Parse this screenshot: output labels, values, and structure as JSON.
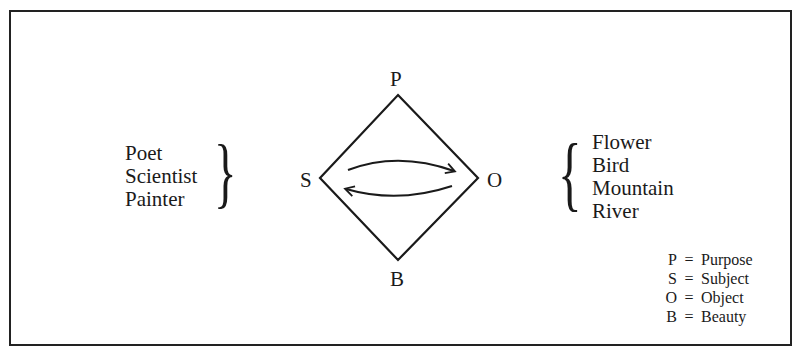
{
  "diagram": {
    "nodes": {
      "top": {
        "label": "P"
      },
      "left": {
        "label": "S"
      },
      "right": {
        "label": "O"
      },
      "bottom": {
        "label": "B"
      }
    },
    "left_group": {
      "items": [
        "Poet",
        "Scientist",
        "Painter"
      ],
      "bracket": "}"
    },
    "right_group": {
      "items": [
        "Flower",
        "Bird",
        "Mountain",
        "River"
      ],
      "bracket": "{"
    },
    "arrows": [
      {
        "from": "S",
        "to": "O",
        "direction": "left-to-right"
      },
      {
        "from": "O",
        "to": "S",
        "direction": "right-to-left"
      }
    ],
    "legend": [
      {
        "key": "P",
        "eq": "=",
        "value": "Purpose"
      },
      {
        "key": "S",
        "eq": "=",
        "value": "Subject"
      },
      {
        "key": "O",
        "eq": "=",
        "value": "Object"
      },
      {
        "key": "B",
        "eq": "=",
        "value": "Beauty"
      }
    ],
    "line_color": "#1a1a1a"
  }
}
